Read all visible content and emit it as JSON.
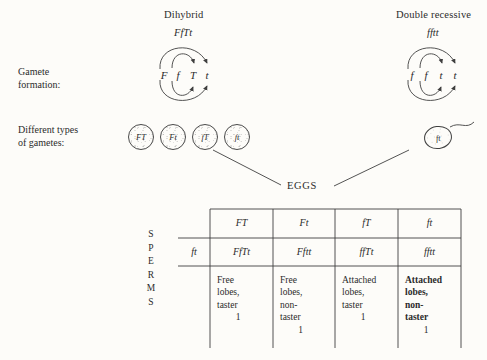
{
  "labels": {
    "gamete_formation": [
      "Gamete",
      "formation:"
    ],
    "different_types": [
      "Different types",
      "of gametes:"
    ],
    "eggs": "EGGS",
    "sperms_letters": [
      "S",
      "P",
      "E",
      "R",
      "M",
      "S"
    ]
  },
  "parents": {
    "left": {
      "name": "Dihybrid",
      "genotype": "FfTt",
      "alleles": [
        "F",
        "f",
        "T",
        "t"
      ]
    },
    "right": {
      "name": "Double recessive",
      "genotype": "fftt",
      "alleles": [
        "f",
        "f",
        "t",
        "t"
      ]
    }
  },
  "gametes": {
    "egg_types": [
      "FT",
      "Ft",
      "fT",
      "ft"
    ],
    "sperm_type": "ft"
  },
  "punnett": {
    "column_headers": [
      "FT",
      "Ft",
      "fT",
      "ft"
    ],
    "row_header": "ft",
    "genotypes": [
      "FfTt",
      "Fftt",
      "ffTt",
      "fftt"
    ],
    "phenotypes": [
      {
        "lines": [
          "Free",
          "lobes,",
          "taster"
        ],
        "count": "1",
        "bold": false
      },
      {
        "lines": [
          "Free",
          "lobes,",
          "non-",
          "taster"
        ],
        "count": "1",
        "bold": false
      },
      {
        "lines": [
          "Attached",
          "lobes,",
          "taster"
        ],
        "count": "1",
        "bold": false
      },
      {
        "lines": [
          "Attached",
          "lobes,",
          "non-",
          "taster"
        ],
        "count": "1",
        "bold": true
      }
    ]
  },
  "colors": {
    "ink": "#2b2b2b",
    "line": "#3f3f3f",
    "background": "#fdfcf9"
  }
}
